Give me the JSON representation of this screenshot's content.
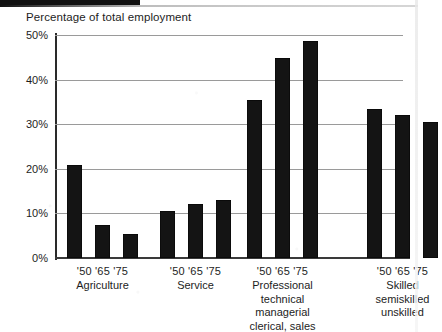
{
  "chart_data": {
    "type": "bar",
    "title": "Percentage of total employment",
    "xlabel": "",
    "ylabel": "Percentage of total employment",
    "ylim": [
      0,
      50
    ],
    "ytick_labels": [
      "0%",
      "10%",
      "20%",
      "30%",
      "40%",
      "50%"
    ],
    "ytick_values": [
      0,
      10,
      20,
      30,
      40,
      50
    ],
    "grid": true,
    "legend": "none",
    "x_subcategories": [
      "'50",
      "'65",
      "'75"
    ],
    "categories": [
      "Agriculture",
      "Service",
      "Professional technical managerial clerical, sales",
      "Skilled semiskilled unskilled"
    ],
    "series": [
      {
        "name": "'50",
        "values": [
          20.8,
          10.5,
          35.5,
          33.3
        ]
      },
      {
        "name": "'65",
        "values": [
          7.3,
          12.0,
          44.8,
          32.0
        ]
      },
      {
        "name": "'75",
        "values": [
          5.3,
          13.0,
          48.6,
          30.5
        ]
      }
    ],
    "groups": [
      {
        "name": "Agriculture",
        "years_label": "'50 '65 '75",
        "name_lines": [
          "Agriculture"
        ],
        "bars": [
          {
            "year": "'50",
            "value": 20.8
          },
          {
            "year": "'65",
            "value": 7.3
          },
          {
            "year": "'75",
            "value": 5.3
          }
        ]
      },
      {
        "name": "Service",
        "years_label": "'50 '65 '75",
        "name_lines": [
          "Service"
        ],
        "bars": [
          {
            "year": "'50",
            "value": 10.5
          },
          {
            "year": "'65",
            "value": 12.0
          },
          {
            "year": "'75",
            "value": 13.0
          }
        ]
      },
      {
        "name": "Professional technical managerial clerical, sales",
        "years_label": "'50 '65 '75",
        "name_lines": [
          "Professional",
          "technical",
          "managerial",
          "clerical, sales"
        ],
        "bars": [
          {
            "year": "'50",
            "value": 35.5
          },
          {
            "year": "'65",
            "value": 44.8
          },
          {
            "year": "'75",
            "value": 48.6
          }
        ]
      },
      {
        "name": "Skilled semiskilled unskilled",
        "years_label": "'50 '65 '75",
        "name_lines": [
          "Skilled",
          "semiskilled",
          "unskilled"
        ],
        "bars": [
          {
            "year": "'50",
            "value": 33.3
          },
          {
            "year": "'65",
            "value": 32.0
          },
          {
            "year": "'75",
            "value": 30.5
          }
        ]
      }
    ],
    "colors": {
      "bar": "#141414",
      "gridline": "#9a9a9a",
      "axis": "#2a2a2a",
      "text": "#1d1d1d",
      "background": "#ffffff"
    }
  }
}
